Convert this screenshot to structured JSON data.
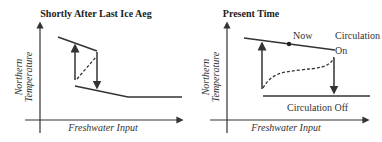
{
  "panels": [
    {
      "title": "Shortly After Last Ice Aeg",
      "xlabel": "Freshwater Input",
      "ylabel_line1": "Northern",
      "ylabel_line2": "Temperature"
    },
    {
      "title": "Present Time",
      "xlabel": "Freshwater Input",
      "ylabel_line1": "Northern",
      "ylabel_line2": "Temperature",
      "annotations": {
        "now": "Now",
        "circulation_on_1": "Circulation",
        "circulation_on_2": "On",
        "circulation_off": "Circulation Off"
      }
    }
  ],
  "colors": {
    "line": "#333333"
  }
}
